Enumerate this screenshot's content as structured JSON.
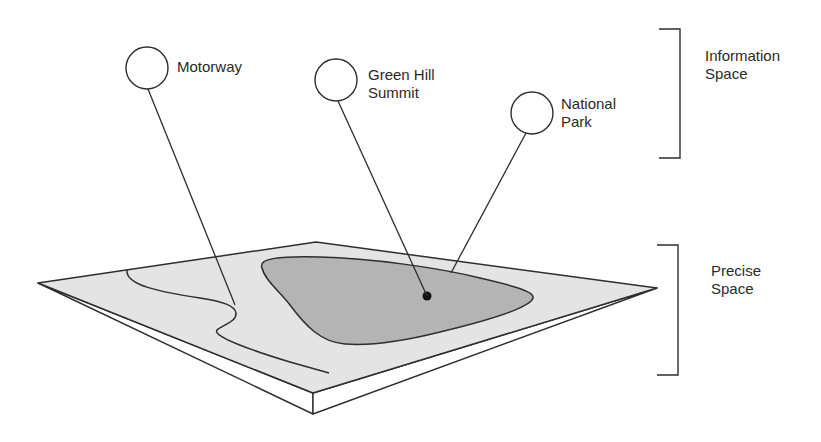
{
  "diagram": {
    "colors": {
      "stroke": "#2e2e2e",
      "plate_fill": "#e4e4e4",
      "region_fill": "#b4b4b4",
      "background": "#ffffff"
    },
    "labels": {
      "motorway": "Motorway",
      "green_hill_summit": "Green Hill\nSummit",
      "national_park": "National\nPark",
      "information_space": "Information\nSpace",
      "precise_space": "Precise\nSpace"
    },
    "nodes": [
      {
        "id": "motorway",
        "label": "Motorway"
      },
      {
        "id": "green-hill-summit",
        "label": "Green Hill Summit"
      },
      {
        "id": "national-park",
        "label": "National Park"
      }
    ],
    "brackets": [
      {
        "id": "information-space",
        "label": "Information Space"
      },
      {
        "id": "precise-space",
        "label": "Precise Space"
      }
    ]
  }
}
